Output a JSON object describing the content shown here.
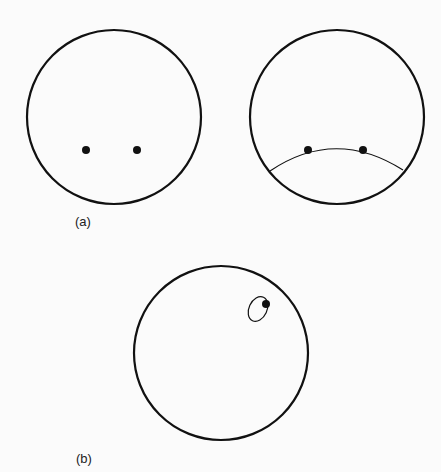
{
  "figure": {
    "panel_a": {
      "label": "(a)",
      "left_circle": {
        "cx": 114,
        "cy": 117,
        "r": 87,
        "dots": [
          {
            "x": 86,
            "y": 150
          },
          {
            "x": 137,
            "y": 150
          }
        ]
      },
      "right_circle": {
        "cx": 337,
        "cy": 117,
        "r": 87,
        "dots": [
          {
            "x": 308,
            "y": 150
          },
          {
            "x": 363,
            "y": 150
          }
        ],
        "arc": "M270,171 Q335,127 403,170"
      }
    },
    "panel_b": {
      "label": "(b)",
      "circle": {
        "cx": 221,
        "cy": 353,
        "r": 87
      },
      "ellipse": {
        "cx": 258,
        "cy": 309,
        "rx": 10,
        "ry": 13,
        "rotate": 25
      },
      "dot": {
        "x": 266,
        "y": 304
      }
    },
    "colors": {
      "stroke": "#111111",
      "background": "#fbfbfb"
    }
  }
}
